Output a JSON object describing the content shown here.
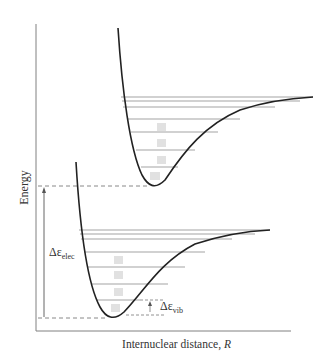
{
  "figure": {
    "axes": {
      "ylabel": "Energy",
      "xlabel_main": "Internuclear distance, ",
      "xlabel_var": "R"
    },
    "annotations": {
      "electronic_gap": {
        "symbol": "Δε",
        "subscript": "elec"
      },
      "vibrational_gap": {
        "symbol": "Δε",
        "subscript": "vib"
      }
    },
    "curves": [
      {
        "name": "upper-electronic-state",
        "minimum_energy_px": 186,
        "dissociation_px": 98,
        "vibrational_level_count": 7
      },
      {
        "name": "ground-electronic-state",
        "minimum_energy_px": 318,
        "dissociation_px": 231,
        "vibrational_level_count": 7
      }
    ],
    "colors": {
      "curve": "#222222",
      "axis": "#777777",
      "levels": "#999999",
      "dashed": "#888888",
      "text": "#333333"
    }
  }
}
